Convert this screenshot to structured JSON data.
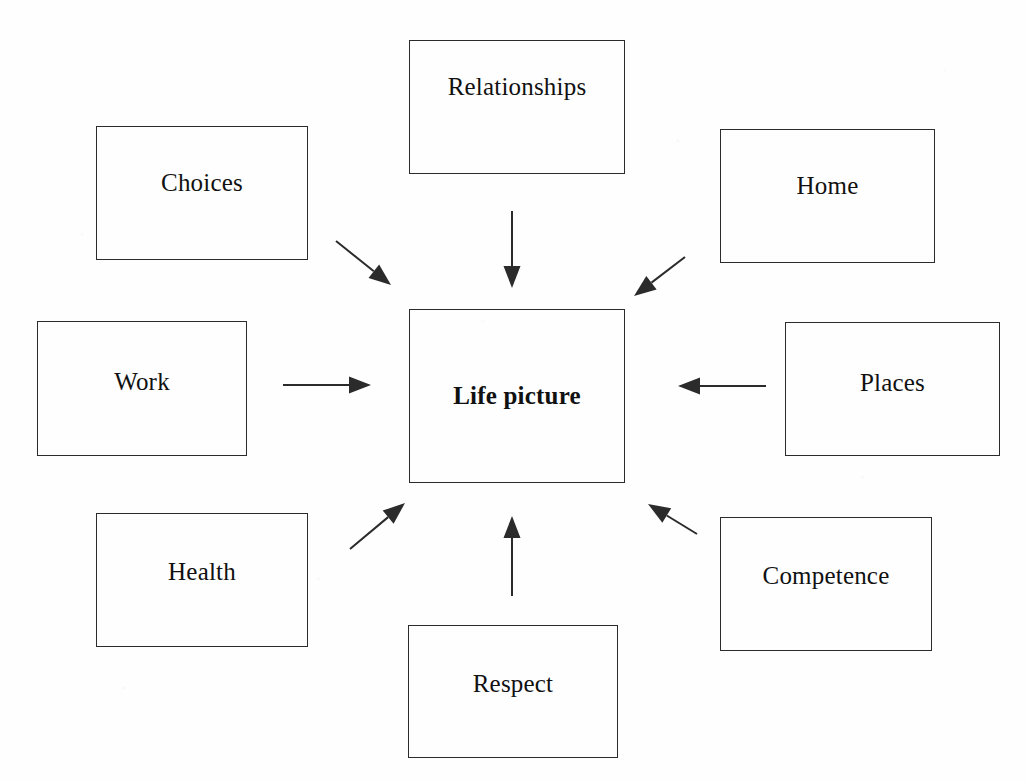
{
  "diagram": {
    "title": "Life picture",
    "type": "hub-and-spoke concept map",
    "background_color": "#fefefe",
    "line_color": "#2b2b2b",
    "text_color": "#111111",
    "center": {
      "id": "life-picture",
      "label": "Life picture",
      "bold": true,
      "box": {
        "x": 409,
        "y": 309,
        "w": 216,
        "h": 174
      },
      "label_offset_y": 0
    },
    "nodes": [
      {
        "id": "relationships",
        "label": "Relationships",
        "box": {
          "x": 409,
          "y": 40,
          "w": 216,
          "h": 134
        },
        "label_offset_y": 32
      },
      {
        "id": "choices",
        "label": "Choices",
        "box": {
          "x": 96,
          "y": 126,
          "w": 212,
          "h": 134
        },
        "label_offset_y": 42
      },
      {
        "id": "home",
        "label": "Home",
        "box": {
          "x": 720,
          "y": 129,
          "w": 215,
          "h": 134
        },
        "label_offset_y": 42
      },
      {
        "id": "work",
        "label": "Work",
        "box": {
          "x": 37,
          "y": 321,
          "w": 210,
          "h": 135
        },
        "label_offset_y": 46
      },
      {
        "id": "places",
        "label": "Places",
        "box": {
          "x": 785,
          "y": 322,
          "w": 215,
          "h": 134
        },
        "label_offset_y": 46
      },
      {
        "id": "health",
        "label": "Health",
        "box": {
          "x": 96,
          "y": 513,
          "w": 212,
          "h": 134
        },
        "label_offset_y": 44
      },
      {
        "id": "competence",
        "label": "Competence",
        "box": {
          "x": 720,
          "y": 517,
          "w": 212,
          "h": 134
        },
        "label_offset_y": 44
      },
      {
        "id": "respect",
        "label": "Respect",
        "box": {
          "x": 408,
          "y": 625,
          "w": 210,
          "h": 133
        },
        "label_offset_y": 44
      }
    ],
    "edges": [
      {
        "id": "choices-to-center",
        "from": "choices",
        "to": "life-picture",
        "x1": 336,
        "y1": 241,
        "x2": 391,
        "y2": 285,
        "direction": "down-right"
      },
      {
        "id": "relationships-to-center",
        "from": "relationships",
        "to": "life-picture",
        "x1": 512,
        "y1": 211,
        "x2": 512,
        "y2": 288,
        "direction": "down"
      },
      {
        "id": "home-to-center",
        "from": "home",
        "to": "life-picture",
        "x1": 685,
        "y1": 257,
        "x2": 634,
        "y2": 296,
        "direction": "down-left"
      },
      {
        "id": "work-to-center",
        "from": "work",
        "to": "life-picture",
        "x1": 283,
        "y1": 385,
        "x2": 371,
        "y2": 385,
        "direction": "right"
      },
      {
        "id": "places-to-center",
        "from": "places",
        "to": "life-picture",
        "x1": 766,
        "y1": 386,
        "x2": 678,
        "y2": 386,
        "direction": "left"
      },
      {
        "id": "health-to-center",
        "from": "health",
        "to": "life-picture",
        "x1": 350,
        "y1": 549,
        "x2": 405,
        "y2": 503,
        "direction": "up-right"
      },
      {
        "id": "respect-to-center",
        "from": "respect",
        "to": "life-picture",
        "x1": 512,
        "y1": 596,
        "x2": 512,
        "y2": 516,
        "direction": "up"
      },
      {
        "id": "competence-to-center",
        "from": "competence",
        "to": "life-picture",
        "x1": 697,
        "y1": 534,
        "x2": 648,
        "y2": 504,
        "direction": "up-left"
      }
    ]
  }
}
